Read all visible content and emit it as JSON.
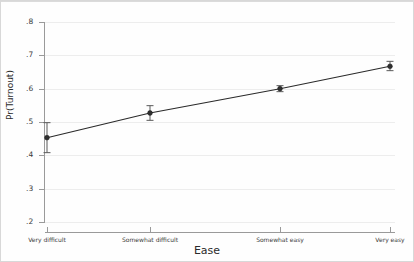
{
  "chart_data": {
    "type": "line",
    "title": "",
    "xlabel": "Ease",
    "ylabel": "Pr(Turnout)",
    "categories": [
      "Very difficult",
      "Somewhat difficult",
      "Somewhat easy",
      "Very easy"
    ],
    "values": [
      0.453,
      0.527,
      0.6,
      0.667
    ],
    "error_low": [
      0.408,
      0.505,
      0.591,
      0.654
    ],
    "error_high": [
      0.498,
      0.549,
      0.609,
      0.682
    ],
    "ylim": [
      0.2,
      0.8
    ],
    "yticks": [
      0.2,
      0.3,
      0.4,
      0.5,
      0.6,
      0.7,
      0.8
    ],
    "ytick_labels": [
      ".2",
      ".3",
      ".4",
      ".5",
      ".6",
      ".7",
      ".8"
    ],
    "grid": true,
    "legend": "none",
    "series": [
      {
        "name": "Predicted probability of turnout",
        "values": [
          0.453,
          0.527,
          0.6,
          0.667
        ]
      }
    ],
    "marker": "filled-circle",
    "errorbar_type": "confidence-interval",
    "line_color": "#2a2a2a",
    "marker_color": "#2f2f2f",
    "errorbar_color": "#5a5a5a",
    "background_color": "#fefefe",
    "grid_color": "#ededed",
    "axis_color": "#9a9a9a"
  },
  "axis": {
    "y_title": "Pr(Turnout)",
    "x_title": "Ease"
  }
}
